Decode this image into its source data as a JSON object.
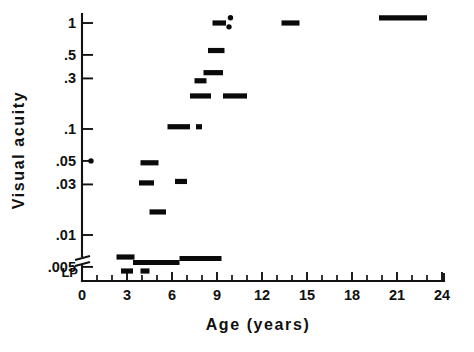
{
  "figure": {
    "title_x": "Age (years)",
    "title_y": "Visual acuity",
    "lp_label": "LP"
  },
  "chart_data": {
    "type": "scatter",
    "title": "",
    "subtitle": "",
    "xlabel": "Age (years)",
    "ylabel": "Visual acuity",
    "xlim": [
      0,
      24
    ],
    "ylim_log": [
      0.004,
      1.3
    ],
    "yscale": "log",
    "grid": false,
    "legend": null,
    "axis_break": {
      "present": true,
      "between": [
        0.005,
        "LP"
      ],
      "note": "double slash break on y-axis below .005, LP category below break"
    },
    "x_ticks_major": [
      0,
      3,
      6,
      9,
      12,
      15,
      18,
      21,
      24
    ],
    "x_ticks_major_labels": [
      "0",
      "3",
      "6",
      "9",
      "12",
      "15",
      "18",
      "21",
      "24"
    ],
    "x_ticks_minor_step": 1,
    "y_ticks": [
      1,
      0.5,
      0.3,
      0.1,
      0.05,
      0.03,
      0.01,
      0.005
    ],
    "y_tick_labels": [
      "1",
      ".5",
      ".3",
      ".1",
      ".05",
      ".03",
      ".01",
      ".005"
    ],
    "y_extra_category": "LP",
    "marker_style": "horizontal-bar-segment",
    "points": [
      {
        "id": "p01",
        "x_start": 0.6,
        "x_end": 0.6,
        "acuity": 0.05,
        "kind": "dot"
      },
      {
        "id": "p02",
        "x_start": 2.3,
        "x_end": 3.5,
        "acuity": 0.0062,
        "kind": "segment"
      },
      {
        "id": "p03",
        "x_start": 2.6,
        "x_end": 3.4,
        "acuity": "LP",
        "kind": "segment"
      },
      {
        "id": "p04",
        "x_start": 3.4,
        "x_end": 6.5,
        "acuity": 0.0055,
        "kind": "segment"
      },
      {
        "id": "p05",
        "x_start": 3.9,
        "x_end": 4.5,
        "acuity": "LP",
        "kind": "segment"
      },
      {
        "id": "p06",
        "x_start": 3.9,
        "x_end": 5.1,
        "acuity": 0.048,
        "kind": "segment"
      },
      {
        "id": "p07",
        "x_start": 3.8,
        "x_end": 4.8,
        "acuity": 0.031,
        "kind": "segment"
      },
      {
        "id": "p08",
        "x_start": 4.5,
        "x_end": 5.6,
        "acuity": 0.0165,
        "kind": "segment"
      },
      {
        "id": "p09",
        "x_start": 6.5,
        "x_end": 9.3,
        "acuity": 0.006,
        "kind": "segment"
      },
      {
        "id": "p10",
        "x_start": 5.7,
        "x_end": 7.2,
        "acuity": 0.105,
        "kind": "segment"
      },
      {
        "id": "p11",
        "x_start": 6.2,
        "x_end": 7.0,
        "acuity": 0.032,
        "kind": "segment"
      },
      {
        "id": "p12",
        "x_start": 7.6,
        "x_end": 8.0,
        "acuity": 0.105,
        "kind": "segment"
      },
      {
        "id": "p13",
        "x_start": 7.2,
        "x_end": 8.6,
        "acuity": 0.205,
        "kind": "segment"
      },
      {
        "id": "p14",
        "x_start": 7.5,
        "x_end": 8.3,
        "acuity": 0.285,
        "kind": "segment"
      },
      {
        "id": "p15",
        "x_start": 8.1,
        "x_end": 9.4,
        "acuity": 0.34,
        "kind": "segment"
      },
      {
        "id": "p16",
        "x_start": 8.4,
        "x_end": 9.5,
        "acuity": 0.55,
        "kind": "segment"
      },
      {
        "id": "p17",
        "x_start": 8.7,
        "x_end": 9.6,
        "acuity": 1.0,
        "kind": "segment"
      },
      {
        "id": "p18",
        "x_start": 9.9,
        "x_end": 9.9,
        "acuity": 1.12,
        "kind": "dot"
      },
      {
        "id": "p19",
        "x_start": 9.8,
        "x_end": 9.8,
        "acuity": 0.92,
        "kind": "dot"
      },
      {
        "id": "p20",
        "x_start": 9.4,
        "x_end": 11.0,
        "acuity": 0.205,
        "kind": "segment"
      },
      {
        "id": "p21",
        "x_start": 13.3,
        "x_end": 14.5,
        "acuity": 1.0,
        "kind": "segment"
      },
      {
        "id": "p22",
        "x_start": 19.8,
        "x_end": 23.0,
        "acuity": 1.12,
        "kind": "segment"
      }
    ]
  }
}
